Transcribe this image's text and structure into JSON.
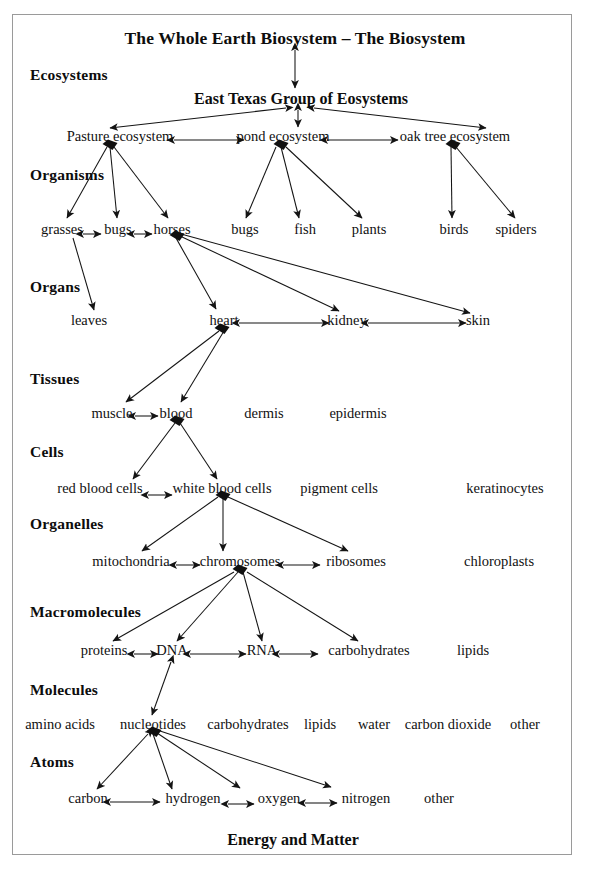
{
  "diagram": {
    "title": "The Whole Earth Biosystem – The Biosystem",
    "footer": "Energy and Matter",
    "group_title": "East Texas Group of Eosystems",
    "frame_color": "#9a9a9a",
    "line_color": "#1a1a1a",
    "text_color": "#111111"
  },
  "levels": [
    {
      "label": "Ecosystems",
      "y": 75
    },
    {
      "label": "Organisms",
      "y": 175
    },
    {
      "label": "Organs",
      "y": 287
    },
    {
      "label": "Tissues",
      "y": 379
    },
    {
      "label": "Cells",
      "y": 452
    },
    {
      "label": "Organelles",
      "y": 524
    },
    {
      "label": "Macromolecules",
      "y": 612
    },
    {
      "label": "Molecules",
      "y": 690
    },
    {
      "label": "Atoms",
      "y": 762
    }
  ],
  "nodes": {
    "ecosystems": [
      {
        "label": "Pasture ecosystem",
        "x": 120,
        "y": 136
      },
      {
        "label": "pond ecosystem",
        "x": 283,
        "y": 136
      },
      {
        "label": "oak tree ecosystem",
        "x": 455,
        "y": 136
      }
    ],
    "organisms": [
      {
        "label": "grasses",
        "x": 62,
        "y": 229
      },
      {
        "label": "bugs",
        "x": 118,
        "y": 229
      },
      {
        "label": "horses",
        "x": 172,
        "y": 229
      },
      {
        "label": "bugs",
        "x": 245,
        "y": 229
      },
      {
        "label": "fish",
        "x": 305,
        "y": 229
      },
      {
        "label": "plants",
        "x": 369,
        "y": 229
      },
      {
        "label": "birds",
        "x": 454,
        "y": 229
      },
      {
        "label": "spiders",
        "x": 516,
        "y": 229
      }
    ],
    "organs": [
      {
        "label": "leaves",
        "x": 89,
        "y": 320
      },
      {
        "label": "heart",
        "x": 224,
        "y": 320
      },
      {
        "label": "kidney",
        "x": 347,
        "y": 320
      },
      {
        "label": "skin",
        "x": 478,
        "y": 320
      }
    ],
    "tissues": [
      {
        "label": "muscle",
        "x": 112,
        "y": 413
      },
      {
        "label": "blood",
        "x": 176,
        "y": 413
      },
      {
        "label": "dermis",
        "x": 264,
        "y": 413
      },
      {
        "label": "epidermis",
        "x": 358,
        "y": 413
      }
    ],
    "cells": [
      {
        "label": "red blood cells",
        "x": 100,
        "y": 488
      },
      {
        "label": "white blood cells",
        "x": 222,
        "y": 488
      },
      {
        "label": "pigment cells",
        "x": 339,
        "y": 488
      },
      {
        "label": "keratinocytes",
        "x": 505,
        "y": 488
      }
    ],
    "organelles": [
      {
        "label": "mitochondria",
        "x": 131,
        "y": 561
      },
      {
        "label": "chromosomes",
        "x": 240,
        "y": 561
      },
      {
        "label": "ribosomes",
        "x": 356,
        "y": 561
      },
      {
        "label": "chloroplasts",
        "x": 499,
        "y": 561
      }
    ],
    "macromolecules": [
      {
        "label": "proteins",
        "x": 104,
        "y": 650
      },
      {
        "label": "DNA",
        "x": 172,
        "y": 650
      },
      {
        "label": "RNA",
        "x": 262,
        "y": 650
      },
      {
        "label": "carbohydrates",
        "x": 369,
        "y": 650
      },
      {
        "label": "lipids",
        "x": 473,
        "y": 650
      }
    ],
    "molecules": [
      {
        "label": "amino acids",
        "x": 60,
        "y": 724
      },
      {
        "label": "nucleotides",
        "x": 153,
        "y": 724
      },
      {
        "label": "carbohydrates",
        "x": 248,
        "y": 724
      },
      {
        "label": "lipids",
        "x": 320,
        "y": 724
      },
      {
        "label": "water",
        "x": 374,
        "y": 724
      },
      {
        "label": "carbon dioxide",
        "x": 448,
        "y": 724
      },
      {
        "label": "other",
        "x": 525,
        "y": 724
      }
    ],
    "atoms": [
      {
        "label": "carbon",
        "x": 88,
        "y": 798
      },
      {
        "label": "hydrogen",
        "x": 193,
        "y": 798
      },
      {
        "label": "oxygen",
        "x": 279,
        "y": 798
      },
      {
        "label": "nitrogen",
        "x": 366,
        "y": 798
      },
      {
        "label": "other",
        "x": 439,
        "y": 798
      }
    ]
  },
  "titles": {
    "main": {
      "x": 295,
      "y": 38
    },
    "group": {
      "x": 301,
      "y": 99
    },
    "footer": {
      "x": 293,
      "y": 840
    }
  },
  "edges": [
    {
      "name": "biosystem-to-group",
      "x1": 295,
      "y1": 50,
      "x2": 295,
      "y2": 88,
      "arrows": "both"
    },
    {
      "name": "group-to-pasture",
      "x1": 286,
      "y1": 108,
      "x2": 110,
      "y2": 128,
      "arrows": "both"
    },
    {
      "name": "group-to-pond",
      "x1": 298,
      "y1": 110,
      "x2": 298,
      "y2": 127,
      "arrows": "both"
    },
    {
      "name": "group-to-oaktree",
      "x1": 314,
      "y1": 108,
      "x2": 486,
      "y2": 128,
      "arrows": "both"
    },
    {
      "name": "pasture-to-pond",
      "x1": 174,
      "y1": 140,
      "x2": 244,
      "y2": 140,
      "arrows": "both"
    },
    {
      "name": "pond-to-oaktree",
      "x1": 327,
      "y1": 140,
      "x2": 398,
      "y2": 140,
      "arrows": "both"
    },
    {
      "name": "pasture-to-grasses",
      "x1": 107,
      "y1": 147,
      "x2": 67,
      "y2": 218,
      "arrows": "end"
    },
    {
      "name": "pasture-to-bugs",
      "x1": 110,
      "y1": 147,
      "x2": 117,
      "y2": 218,
      "arrows": "end"
    },
    {
      "name": "pasture-to-horses",
      "x1": 114,
      "y1": 147,
      "x2": 168,
      "y2": 218,
      "arrows": "end"
    },
    {
      "name": "pond-to-bugs",
      "x1": 276,
      "y1": 147,
      "x2": 246,
      "y2": 218,
      "arrows": "end"
    },
    {
      "name": "pond-to-fish",
      "x1": 281,
      "y1": 147,
      "x2": 299,
      "y2": 218,
      "arrows": "end"
    },
    {
      "name": "pond-to-plants",
      "x1": 286,
      "y1": 147,
      "x2": 362,
      "y2": 218,
      "arrows": "end"
    },
    {
      "name": "oaktree-to-birds",
      "x1": 451,
      "y1": 147,
      "x2": 452,
      "y2": 218,
      "arrows": "end"
    },
    {
      "name": "oaktree-to-spiders",
      "x1": 456,
      "y1": 147,
      "x2": 515,
      "y2": 218,
      "arrows": "end"
    },
    {
      "name": "grasses-to-bugs",
      "x1": 83,
      "y1": 234,
      "x2": 101,
      "y2": 234,
      "arrows": "both"
    },
    {
      "name": "bugs-to-horses",
      "x1": 134,
      "y1": 234,
      "x2": 152,
      "y2": 234,
      "arrows": "both"
    },
    {
      "name": "grasses-to-leaves",
      "x1": 73,
      "y1": 238,
      "x2": 94,
      "y2": 310,
      "arrows": "end"
    },
    {
      "name": "horses-to-heart",
      "x1": 176,
      "y1": 238,
      "x2": 216,
      "y2": 309,
      "arrows": "end"
    },
    {
      "name": "horses-to-kidney",
      "x1": 180,
      "y1": 236,
      "x2": 339,
      "y2": 311,
      "arrows": "end"
    },
    {
      "name": "horses-to-skin",
      "x1": 181,
      "y1": 234,
      "x2": 470,
      "y2": 313,
      "arrows": "end"
    },
    {
      "name": "heart-to-kidney",
      "x1": 239,
      "y1": 323,
      "x2": 329,
      "y2": 323,
      "arrows": "both"
    },
    {
      "name": "kidney-to-skin",
      "x1": 368,
      "y1": 323,
      "x2": 466,
      "y2": 323,
      "arrows": "both"
    },
    {
      "name": "heart-to-muscle",
      "x1": 219,
      "y1": 331,
      "x2": 126,
      "y2": 402,
      "arrows": "end"
    },
    {
      "name": "heart-to-blood",
      "x1": 224,
      "y1": 331,
      "x2": 181,
      "y2": 402,
      "arrows": "end"
    },
    {
      "name": "muscle-to-blood",
      "x1": 135,
      "y1": 416,
      "x2": 158,
      "y2": 416,
      "arrows": "both"
    },
    {
      "name": "blood-to-redcells",
      "x1": 175,
      "y1": 423,
      "x2": 133,
      "y2": 479,
      "arrows": "end"
    },
    {
      "name": "blood-to-whitecells",
      "x1": 180,
      "y1": 423,
      "x2": 217,
      "y2": 479,
      "arrows": "end"
    },
    {
      "name": "redcells-to-whitecells",
      "x1": 148,
      "y1": 495,
      "x2": 172,
      "y2": 495,
      "arrows": "both"
    },
    {
      "name": "whitecells-to-mitochondria",
      "x1": 218,
      "y1": 497,
      "x2": 142,
      "y2": 551,
      "arrows": "end"
    },
    {
      "name": "whitecells-to-chromosomes",
      "x1": 223,
      "y1": 497,
      "x2": 223,
      "y2": 551,
      "arrows": "end"
    },
    {
      "name": "whitecells-to-ribosomes",
      "x1": 228,
      "y1": 497,
      "x2": 348,
      "y2": 551,
      "arrows": "end"
    },
    {
      "name": "mitochondria-to-chromosomes",
      "x1": 176,
      "y1": 565,
      "x2": 200,
      "y2": 565,
      "arrows": "both"
    },
    {
      "name": "chromosomes-to-ribosomes",
      "x1": 283,
      "y1": 565,
      "x2": 320,
      "y2": 565,
      "arrows": "both"
    },
    {
      "name": "chromosomes-to-proteins",
      "x1": 234,
      "y1": 572,
      "x2": 113,
      "y2": 641,
      "arrows": "end"
    },
    {
      "name": "chromosomes-to-dna",
      "x1": 238,
      "y1": 572,
      "x2": 177,
      "y2": 641,
      "arrows": "end"
    },
    {
      "name": "chromosomes-to-rna",
      "x1": 243,
      "y1": 572,
      "x2": 262,
      "y2": 641,
      "arrows": "end"
    },
    {
      "name": "chromosomes-to-carbohydrates",
      "x1": 247,
      "y1": 572,
      "x2": 358,
      "y2": 641,
      "arrows": "end"
    },
    {
      "name": "proteins-to-dna",
      "x1": 134,
      "y1": 654,
      "x2": 158,
      "y2": 654,
      "arrows": "both"
    },
    {
      "name": "dna-to-rna",
      "x1": 190,
      "y1": 654,
      "x2": 246,
      "y2": 654,
      "arrows": "both"
    },
    {
      "name": "rna-to-carbohydrates",
      "x1": 279,
      "y1": 654,
      "x2": 318,
      "y2": 654,
      "arrows": "both"
    },
    {
      "name": "dna-to-nucleotides",
      "x1": 171,
      "y1": 662,
      "x2": 152,
      "y2": 715,
      "arrows": "both"
    },
    {
      "name": "nucleotides-to-carbon",
      "x1": 148,
      "y1": 734,
      "x2": 97,
      "y2": 789,
      "arrows": "both"
    },
    {
      "name": "nucleotides-to-hydrogen",
      "x1": 153,
      "y1": 734,
      "x2": 172,
      "y2": 789,
      "arrows": "end"
    },
    {
      "name": "nucleotides-to-oxygen",
      "x1": 157,
      "y1": 733,
      "x2": 240,
      "y2": 788,
      "arrows": "end"
    },
    {
      "name": "nucleotides-to-nitrogen",
      "x1": 160,
      "y1": 731,
      "x2": 331,
      "y2": 787,
      "arrows": "end"
    },
    {
      "name": "carbon-to-hydrogen",
      "x1": 110,
      "y1": 802,
      "x2": 160,
      "y2": 802,
      "arrows": "both"
    },
    {
      "name": "hydrogen-to-oxygen",
      "x1": 228,
      "y1": 804,
      "x2": 254,
      "y2": 804,
      "arrows": "both"
    },
    {
      "name": "oxygen-to-nitrogen",
      "x1": 305,
      "y1": 803,
      "x2": 337,
      "y2": 803,
      "arrows": "both"
    }
  ],
  "hubs": [
    {
      "name": "pasture-hub",
      "x": 110,
      "y": 145
    },
    {
      "name": "pond-hub",
      "x": 281,
      "y": 145
    },
    {
      "name": "oaktree-hub",
      "x": 453,
      "y": 145
    },
    {
      "name": "horses-hub",
      "x": 177,
      "y": 236
    },
    {
      "name": "heart-hub",
      "x": 222,
      "y": 329
    },
    {
      "name": "blood-hub",
      "x": 177,
      "y": 421
    },
    {
      "name": "whitecells-hub",
      "x": 223,
      "y": 496
    },
    {
      "name": "chromosomes-hub",
      "x": 240,
      "y": 570
    },
    {
      "name": "nucleotides-hub",
      "x": 154,
      "y": 732
    }
  ]
}
